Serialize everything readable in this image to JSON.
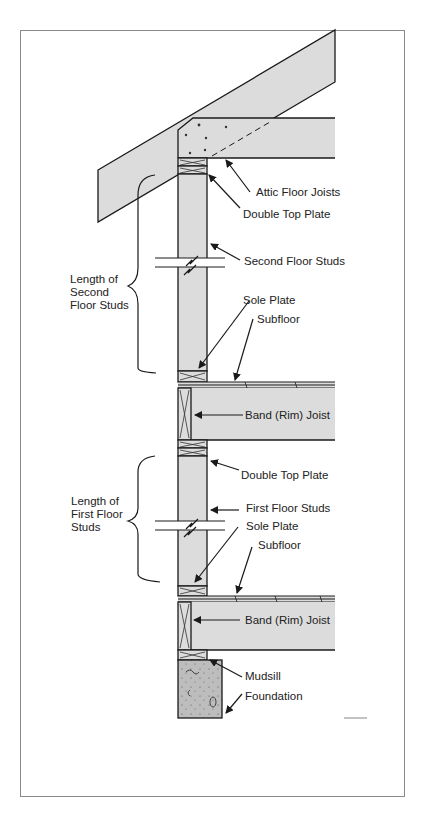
{
  "diagram": {
    "colors": {
      "wood_fill": "#dcdcdc",
      "concrete_fill": "#bdbdbd",
      "outline": "#1a1a1a",
      "frame_border": "#8a8a8a"
    },
    "labels": {
      "attic_floor_joists": "Attic Floor Joists",
      "double_top_plate_upper": "Double Top Plate",
      "second_floor_studs": "Second Floor Studs",
      "sole_plate_upper": "Sole Plate",
      "subfloor_upper": "Subfloor",
      "band_joist_upper": "Band (Rim) Joist",
      "double_top_plate_lower": "Double Top Plate",
      "first_floor_studs": "First Floor Studs",
      "sole_plate_lower": "Sole Plate",
      "subfloor_lower": "Subfloor",
      "band_joist_lower": "Band (Rim) Joist",
      "mudsill": "Mudsill",
      "foundation": "Foundation"
    },
    "brackets": {
      "second": [
        "Length of",
        "Second",
        "Floor Studs"
      ],
      "first": [
        "Length of",
        "First Floor",
        "Studs"
      ]
    }
  }
}
